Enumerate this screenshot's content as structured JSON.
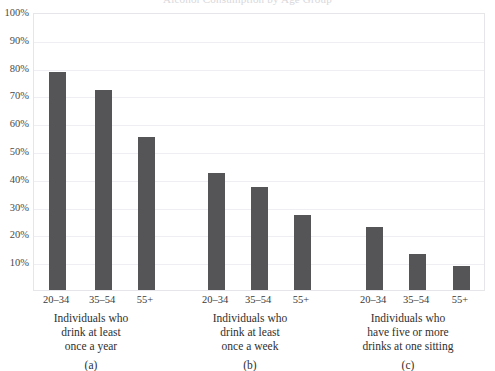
{
  "chart_data": {
    "type": "bar",
    "title": "Alcohol Consumption by Age Group",
    "xlabel": "",
    "ylabel": "",
    "ylim": [
      0,
      100
    ],
    "y_unit": "%",
    "grid": true,
    "legend": "none",
    "categories": [
      "20–34",
      "35–54",
      "55+"
    ],
    "y_ticks": [
      "10%",
      "20%",
      "30%",
      "40%",
      "50%",
      "60%",
      "70%",
      "80%",
      "90%",
      "100%"
    ],
    "y_tick_values": [
      10,
      20,
      30,
      40,
      50,
      60,
      70,
      80,
      90,
      100
    ],
    "panels": [
      {
        "tag": "(a)",
        "description_lines": [
          "Individuals who",
          "drink at least",
          "once a year"
        ],
        "values": [
          78.5,
          72,
          55
        ]
      },
      {
        "tag": "(b)",
        "description_lines": [
          "Individuals who",
          "drink at least",
          "once a week"
        ],
        "values": [
          42,
          37,
          27
        ]
      },
      {
        "tag": "(c)",
        "description_lines": [
          "Individuals who",
          "have five or more",
          "drinks at one sitting"
        ],
        "values": [
          22.5,
          13,
          8.5
        ]
      }
    ],
    "colors": {
      "bar": "#555558",
      "gridline": "#efeff3",
      "frame": "#e6e6ea",
      "text": "#3a3a3a",
      "background": "#ffffff"
    }
  }
}
